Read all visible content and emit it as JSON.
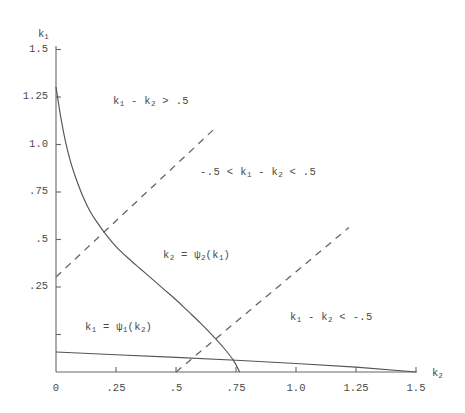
{
  "chart_data": {
    "type": "line",
    "title": "",
    "xlabel": "k2",
    "ylabel": "k1",
    "xlim": [
      0,
      1.55
    ],
    "ylim": [
      0,
      1.55
    ],
    "grid": false,
    "legend": "none",
    "x_ticks": [
      "0",
      ".25",
      ".5",
      ".75",
      "1.0",
      "1.25",
      "1.5"
    ],
    "x_tick_values": [
      0,
      0.25,
      0.5,
      0.75,
      1.0,
      1.25,
      1.5
    ],
    "y_ticks": [
      ".25",
      ".5",
      ".75",
      "1.0",
      "1.25",
      "1.5"
    ],
    "y_tick_values": [
      0.25,
      0.5,
      0.75,
      1.0,
      1.25,
      1.5
    ],
    "series": [
      {
        "name": "k2 = psi2(k1)",
        "style": "solid",
        "color": "#555555",
        "points": [
          [
            0.0,
            1.5
          ],
          [
            0.02,
            1.34
          ],
          [
            0.04,
            1.21
          ],
          [
            0.06,
            1.11
          ],
          [
            0.08,
            1.03
          ],
          [
            0.11,
            0.93
          ],
          [
            0.14,
            0.85
          ],
          [
            0.17,
            0.79
          ],
          [
            0.21,
            0.72
          ],
          [
            0.25,
            0.66
          ],
          [
            0.3,
            0.6
          ],
          [
            0.35,
            0.545
          ],
          [
            0.4,
            0.49
          ],
          [
            0.45,
            0.435
          ],
          [
            0.5,
            0.38
          ],
          [
            0.55,
            0.32
          ],
          [
            0.6,
            0.26
          ],
          [
            0.65,
            0.195
          ],
          [
            0.7,
            0.125
          ],
          [
            0.74,
            0.06
          ],
          [
            0.765,
            0.0
          ]
        ]
      },
      {
        "name": "k1 = psi1(k2)",
        "style": "solid",
        "color": "#555555",
        "points": [
          [
            0.0,
            0.105
          ],
          [
            0.25,
            0.091
          ],
          [
            0.5,
            0.077
          ],
          [
            0.75,
            0.062
          ],
          [
            1.0,
            0.045
          ],
          [
            1.25,
            0.026
          ],
          [
            1.5,
            0.0
          ]
        ]
      },
      {
        "name": "k1 - k2 = .5 boundary",
        "style": "dashed",
        "color": "#666666",
        "points": [
          [
            0.0,
            0.5
          ],
          [
            0.66,
            1.28
          ]
        ]
      },
      {
        "name": "k1 - k2 = -.5 boundary",
        "style": "dashed",
        "color": "#666666",
        "points": [
          [
            0.5,
            0.0
          ],
          [
            1.22,
            0.76
          ]
        ]
      }
    ],
    "annotations": [
      {
        "text": "k1 - k2 > .5",
        "x": 0.38,
        "y": 1.19
      },
      {
        "text": "-.5 < k1 - k2 < .5",
        "x": 0.77,
        "y": 0.93
      },
      {
        "text": "k1 - k2 < -.5",
        "x": 1.02,
        "y": 0.31
      },
      {
        "text": "k2 = psi2(k1)",
        "x": 0.46,
        "y": 0.49
      },
      {
        "text": "k1 = psi1(k2)",
        "x": 0.13,
        "y": 0.15
      }
    ]
  },
  "axes": {
    "y_title": "k",
    "y_title_sub": "1",
    "x_title": "k",
    "x_title_sub": "2",
    "x_ticks": [
      {
        "label": "0"
      },
      {
        "label": ".25"
      },
      {
        "label": ".5"
      },
      {
        "label": ".75"
      },
      {
        "label": "1.0"
      },
      {
        "label": "1.25"
      },
      {
        "label": "1.5"
      }
    ],
    "y_ticks": [
      {
        "label": "1.5"
      },
      {
        "label": "1.25"
      },
      {
        "label": "1.0"
      },
      {
        "label": ".75"
      },
      {
        "label": ".5"
      },
      {
        "label": ".25"
      }
    ]
  },
  "labels": {
    "region_above": {
      "lead": "k",
      "sub1": "1",
      "mid": " - k",
      "sub2": "2",
      "tail": " > .5"
    },
    "region_middle": {
      "lead": "-.5 < k",
      "sub1": "1",
      "mid": " - k",
      "sub2": "2",
      "tail": " < .5"
    },
    "region_below": {
      "lead": "k",
      "sub1": "1",
      "mid": " - k",
      "sub2": "2",
      "tail": " < -.5"
    },
    "curve_psi2": {
      "lead": "k",
      "sub1": "2",
      "mid": " = ψ",
      "sub2": "2",
      "tail": "(k",
      "sub3": "1",
      "close": ")"
    },
    "curve_psi1": {
      "lead": "k",
      "sub1": "1",
      "mid": " = ψ",
      "sub2": "1",
      "tail": "(k",
      "sub3": "2",
      "close": ")"
    }
  },
  "colors": {
    "line": "#555555",
    "dash": "#666666",
    "text": "#4a4a4a",
    "background": "#ffffff"
  }
}
